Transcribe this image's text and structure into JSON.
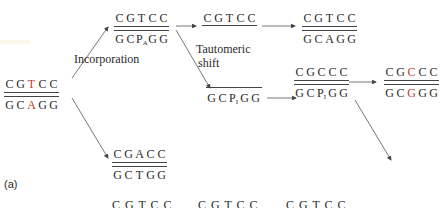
{
  "panel_label": "(a)",
  "labels": {
    "incorporation": "Incorporation",
    "tautomeric_1": "Tautomeric",
    "tautomeric_2": "shift"
  },
  "duplexes": {
    "start": {
      "top": [
        "C",
        "G",
        "T",
        "C",
        "C"
      ],
      "bottom": [
        "G",
        "C",
        "A",
        "G",
        "G"
      ],
      "highlight_top": 2,
      "highlight_bottom": 2
    },
    "incorporated": {
      "top": [
        "C",
        "G",
        "T",
        "C",
        "C"
      ],
      "bottom": [
        "G",
        "C",
        "P_A",
        "G",
        "G"
      ]
    },
    "replicate_top": {
      "top": [
        "C",
        "G",
        "T",
        "C",
        "C"
      ],
      "bottom": []
    },
    "normal_result": {
      "top": [
        "C",
        "G",
        "T",
        "C",
        "C"
      ],
      "bottom": [
        "G",
        "C",
        "A",
        "G",
        "G"
      ]
    },
    "tautomer": {
      "top": [],
      "bottom": [
        "G",
        "C",
        "P_I",
        "G",
        "G"
      ]
    },
    "mispaired": {
      "top": [
        "C",
        "G",
        "C",
        "C",
        "C"
      ],
      "bottom": [
        "G",
        "C",
        "P_I",
        "G",
        "G"
      ]
    },
    "mutant": {
      "top": [
        "C",
        "G",
        "C",
        "C",
        "C"
      ],
      "bottom": [
        "G",
        "C",
        "G",
        "G",
        "G"
      ],
      "highlight_top": 2,
      "highlight_bottom": 2
    },
    "alt": {
      "top": [
        "C",
        "G",
        "A",
        "C",
        "C"
      ],
      "bottom": [
        "G",
        "C",
        "T",
        "G",
        "G"
      ]
    }
  },
  "bottom_row": [
    "C G T C C",
    "C G T C C",
    "C G T C C"
  ],
  "colors": {
    "highlight": "#c0392b",
    "ink": "#2a2a2a"
  }
}
